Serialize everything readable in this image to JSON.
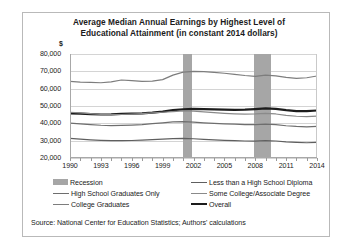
{
  "chart_data": {
    "type": "line",
    "title": "Average Median Annual Earnings by Highest Level of Educational Attainment (in constant 2014 dollars)",
    "title_line1": "Average Median Annual Earnings by Highest Level of",
    "title_line2": "Educational Attainment (in constant 2014 dollars)",
    "xlabel": "",
    "ylabel": "$",
    "ylim": [
      20000,
      80000
    ],
    "ytick_step": 10000,
    "ytick_labels": [
      "80,000",
      "70,000",
      "60,000",
      "50,000",
      "40,000",
      "30,000",
      "20,000"
    ],
    "ytick_values": [
      80000,
      70000,
      60000,
      50000,
      40000,
      30000,
      20000
    ],
    "xlim": [
      1990,
      2014
    ],
    "xtick_labels": [
      "1990",
      "1993",
      "1996",
      "1999",
      "2002",
      "2005",
      "2008",
      "2011",
      "2014"
    ],
    "xtick_values": [
      1990,
      1993,
      1996,
      1999,
      2002,
      2005,
      2008,
      2011,
      2014
    ],
    "grid": true,
    "legend_position": "bottom",
    "x": [
      1990,
      1991,
      1992,
      1993,
      1994,
      1995,
      1996,
      1997,
      1998,
      1999,
      2000,
      2001,
      2002,
      2003,
      2004,
      2005,
      2006,
      2007,
      2008,
      2009,
      2010,
      2011,
      2012,
      2013,
      2014
    ],
    "recession_bands": [
      {
        "label": "Recession",
        "start": 2001.0,
        "end": 2001.9
      },
      {
        "label": "Recession",
        "start": 2007.9,
        "end": 2009.5
      }
    ],
    "series": [
      {
        "name": "College Graduates",
        "color": "#7d7d7d",
        "width": 1.2,
        "values": [
          64200,
          63800,
          63600,
          63400,
          63900,
          65000,
          64600,
          64200,
          64400,
          65200,
          67800,
          69500,
          70000,
          69800,
          69400,
          68900,
          68300,
          67600,
          67100,
          67800,
          67400,
          66500,
          65900,
          66300,
          67300
        ]
      },
      {
        "name": "Overall",
        "color": "#1c1c1c",
        "width": 2.2,
        "values": [
          45800,
          45600,
          45300,
          45100,
          45200,
          45500,
          45600,
          45800,
          46200,
          46800,
          47600,
          48100,
          48300,
          48200,
          48000,
          47900,
          47800,
          47900,
          48200,
          48600,
          48300,
          47600,
          47100,
          47000,
          47400
        ]
      },
      {
        "name": "Some College/Associate Degree",
        "color": "#8a8a8a",
        "width": 1.2,
        "values": [
          46400,
          46000,
          45600,
          45200,
          45000,
          45100,
          45300,
          45600,
          46000,
          46400,
          46800,
          47200,
          47000,
          46600,
          46200,
          45800,
          45500,
          45300,
          45400,
          45800,
          45400,
          44600,
          44100,
          43900,
          44200
        ]
      },
      {
        "name": "High School Graduates Only",
        "color": "#6e6e6e",
        "width": 1.2,
        "values": [
          40100,
          39700,
          39300,
          38900,
          38700,
          38800,
          39000,
          39300,
          39800,
          40300,
          40800,
          41000,
          40700,
          40300,
          40000,
          39700,
          39500,
          39300,
          39200,
          39600,
          39300,
          38600,
          38200,
          38000,
          38200
        ]
      },
      {
        "name": "Less than a High School Diploma",
        "color": "#5f5f5f",
        "width": 1.2,
        "values": [
          31300,
          30900,
          30500,
          30200,
          30000,
          30000,
          30100,
          30300,
          30600,
          30900,
          31200,
          31300,
          31100,
          30800,
          30500,
          30200,
          30000,
          29800,
          29700,
          30000,
          29800,
          29300,
          29000,
          28800,
          29000
        ]
      }
    ],
    "legend_entries": [
      {
        "label": "Recession",
        "swatch": "box",
        "color": "#a6a6a6"
      },
      {
        "label": "Less than a High School Diploma",
        "swatch": "line",
        "color": "#5f5f5f"
      },
      {
        "label": "High School Graduates Only",
        "swatch": "line",
        "color": "#6e6e6e"
      },
      {
        "label": "Some College/Associate Degree",
        "swatch": "line",
        "color": "#8a8a8a"
      },
      {
        "label": "College Graduates",
        "swatch": "line",
        "color": "#7d7d7d"
      },
      {
        "label": "Overall",
        "swatch": "line-bold",
        "color": "#1c1c1c"
      }
    ],
    "source_note": "Source: National Center for Education Statistics; Authors' calculations"
  }
}
